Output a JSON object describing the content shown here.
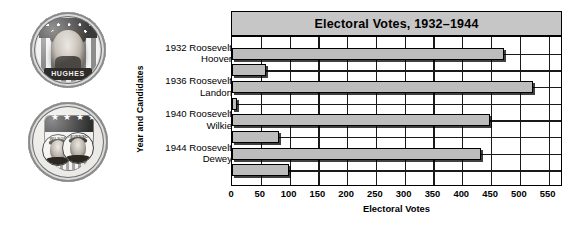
{
  "figure": {
    "caption_images": [
      {
        "name": "hughes-campaign-button",
        "inscription": "HUGHES",
        "description": "round campaign pin with flag stripes, star canton and bearded portrait"
      },
      {
        "name": "dual-portrait-campaign-button",
        "left_name": "WILSON",
        "right_name": "STEVENSON",
        "stars": "★ ★ ★ ★ ★",
        "description": "round campaign pin with shield, five stars and two portraits"
      }
    ]
  },
  "chart_data": {
    "type": "bar",
    "orientation": "horizontal",
    "title": "Electoral Votes, 1932–1944",
    "xlabel": "Electoral Votes",
    "ylabel": "Year and Candidates",
    "xlim": [
      0,
      575
    ],
    "xticks": [
      0,
      50,
      100,
      150,
      200,
      250,
      300,
      350,
      400,
      450,
      500,
      550
    ],
    "xtick_labels": [
      "0",
      "50",
      "100",
      "150",
      "200",
      "250",
      "300",
      "350",
      "400",
      "450",
      "500",
      "550"
    ],
    "grid": true,
    "legend": "none",
    "groups": [
      {
        "year": "1932",
        "winner": "Roosevelt",
        "opponent": "Hoover"
      },
      {
        "year": "1936",
        "winner": "Roosevelt",
        "opponent": "Landon"
      },
      {
        "year": "1940",
        "winner": "Roosevelt",
        "opponent": "Wilkie"
      },
      {
        "year": "1944",
        "winner": "Roosevelt",
        "opponent": "Dewey"
      }
    ],
    "categories": [
      "1932 Roosevelt",
      "Hoover",
      "1936 Roosevelt",
      "Landon",
      "1940 Roosevelt",
      "Wilkie",
      "1944 Roosevelt",
      "Dewey"
    ],
    "values": [
      472,
      59,
      523,
      8,
      449,
      82,
      432,
      99
    ],
    "bar_color": "#bdbdbd",
    "bar_edge_color": "#000000",
    "title_band_color": "#c6c6c6"
  }
}
